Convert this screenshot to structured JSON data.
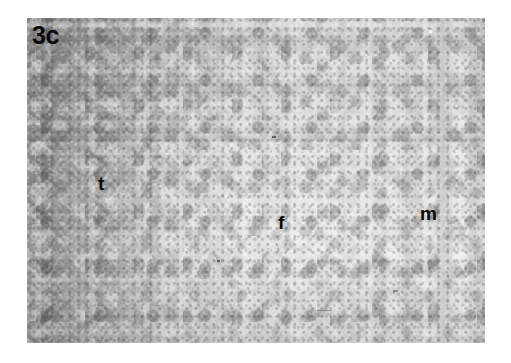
{
  "figure": {
    "panel_label": "3c",
    "media": "grayscale-histology-micrograph",
    "background_color": "#ffffff",
    "plate": {
      "left": 27,
      "top": 18,
      "width": 458,
      "height": 325,
      "base_color": "#c4c4c4",
      "dark_tone": "#6e6e6e",
      "light_tone": "#f2f2f2"
    },
    "annotations": [
      {
        "key": "t",
        "text": "t",
        "meaning": "tumour-region",
        "x": 102,
        "y": 182,
        "region_tone": "dark-mottled"
      },
      {
        "key": "f",
        "text": "f",
        "meaning": "fibrous-region",
        "x": 285,
        "y": 220,
        "region_tone": "pale-fine-grained"
      },
      {
        "key": "m",
        "text": "m",
        "meaning": "muscle-region",
        "x": 428,
        "y": 212,
        "region_tone": "bright-coarse-mottled"
      }
    ]
  }
}
